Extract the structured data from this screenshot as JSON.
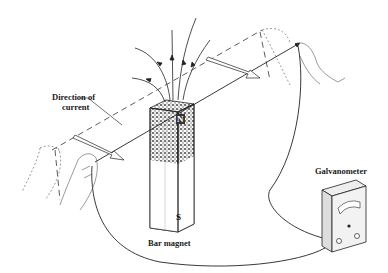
{
  "diagram": {
    "labels": {
      "direction_line1": "Direction of",
      "direction_line2": "current",
      "bar_magnet": "Bar magnet",
      "galvanometer": "Galvanometer",
      "north_pole": "N",
      "south_pole": "S"
    },
    "colors": {
      "ink": "#222222",
      "background": "#ffffff",
      "stipple": "#555555"
    }
  }
}
